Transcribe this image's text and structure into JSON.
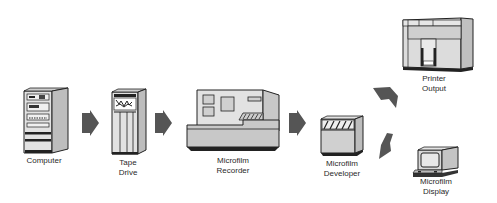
{
  "diagram": {
    "type": "flow",
    "nodes": [
      {
        "id": "computer",
        "label": "Computer"
      },
      {
        "id": "tape_drive",
        "label": "Tape\nDrive"
      },
      {
        "id": "microfilm_recorder",
        "label": "Microfilm\nRecorder"
      },
      {
        "id": "microfilm_developer",
        "label": "Microfilm\nDeveloper"
      },
      {
        "id": "printer_output",
        "label": "Printer\nOutput"
      },
      {
        "id": "microfilm_display",
        "label": "Microfilm\nDisplay"
      }
    ],
    "edges": [
      {
        "from": "computer",
        "to": "tape_drive"
      },
      {
        "from": "tape_drive",
        "to": "microfilm_recorder"
      },
      {
        "from": "microfilm_recorder",
        "to": "microfilm_developer"
      },
      {
        "from": "microfilm_developer",
        "to": "printer_output"
      },
      {
        "from": "microfilm_developer",
        "to": "microfilm_display"
      }
    ],
    "colors": {
      "arrow": "#555555",
      "device_fill": "#d4d4d4",
      "device_side": "#bdbdbd",
      "outline": "#222222",
      "background": "#ffffff"
    }
  }
}
